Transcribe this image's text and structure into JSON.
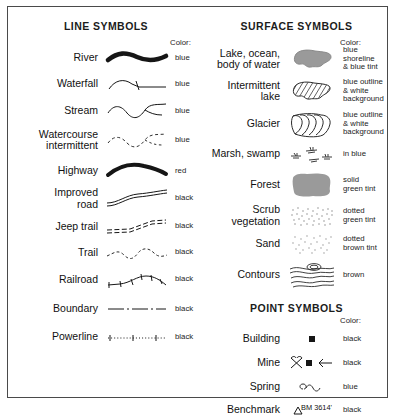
{
  "legend": {
    "sections": [
      {
        "id": "line-symbols",
        "title": "LINE SYMBOLS",
        "color_header": "Color:",
        "rows": [
          {
            "label": "River",
            "symbol": "river-thick-wavy-line",
            "color": "blue"
          },
          {
            "label": "Waterfall",
            "symbol": "waterfall-line-with-tick",
            "color": "blue"
          },
          {
            "label": "Stream",
            "symbol": "stream-thin-wavy-line",
            "color": "blue"
          },
          {
            "label": "Watercourse\nintermittent",
            "symbol": "watercourse-intermittent-dashed-line",
            "color": "blue"
          },
          {
            "label": "Highway",
            "symbol": "highway-thick-tapered-line",
            "color": "red"
          },
          {
            "label": "Improved\nroad",
            "symbol": "improved-road-double-line",
            "color": "black"
          },
          {
            "label": "Jeep trail",
            "symbol": "jeep-trail-double-dashed-line",
            "color": "black"
          },
          {
            "label": "Trail",
            "symbol": "trail-broken-dashed-line",
            "color": "black"
          },
          {
            "label": "Railroad",
            "symbol": "railroad-line-with-crossties",
            "color": "black"
          },
          {
            "label": "Boundary",
            "symbol": "boundary-dash-dot-line",
            "color": "black"
          },
          {
            "label": "Powerline",
            "symbol": "powerline-dotted-line-with-ticks",
            "color": "black"
          }
        ]
      },
      {
        "id": "surface-symbols",
        "title": "SURFACE SYMBOLS",
        "color_header": "Color:",
        "rows": [
          {
            "label": "Lake, ocean,\nbody of water",
            "symbol": "lake-solid-fill-blob",
            "color": "blue shoreline\n& blue tint"
          },
          {
            "label": "Intermittent\nlake",
            "symbol": "intermittent-lake-hatched-blob",
            "color": "blue outline\n& white\nbackground"
          },
          {
            "label": "Glacier",
            "symbol": "glacier-nested-curves",
            "color": "blue outline\n& white\nbackground"
          },
          {
            "label": "Marsh, swamp",
            "symbol": "marsh-swamp-grass-tufts",
            "color": "in blue"
          },
          {
            "label": "Forest",
            "symbol": "forest-solid-tint-blob",
            "color": "solid\ngreen tint"
          },
          {
            "label": "Scrub\nvegetation",
            "symbol": "scrub-vegetation-stipple",
            "color": "dotted\ngreen tint"
          },
          {
            "label": "Sand",
            "symbol": "sand-stipple",
            "color": "dotted\nbrown tint"
          },
          {
            "label": "Contours",
            "symbol": "contours-nested-wavy-lines",
            "color": "brown"
          }
        ]
      },
      {
        "id": "point-symbols",
        "title": "POINT SYMBOLS",
        "color_header": "Color:",
        "rows": [
          {
            "label": "Building",
            "symbol": "building-filled-square",
            "color": "black"
          },
          {
            "label": "Mine",
            "symbol": "mine-crossed-picks-square-shaft",
            "color": "black"
          },
          {
            "label": "Spring",
            "symbol": "spring-loop-with-wavy-tail",
            "color": "blue"
          },
          {
            "label": "Benchmark",
            "symbol": "benchmark-triangle",
            "color": "black",
            "annotation": "BM 3614'"
          }
        ]
      }
    ]
  },
  "palette": {
    "border": "#4a4a4a",
    "ink": "#111111",
    "fill_gray": "#9a9a9a",
    "stipple": "#8d8d8d"
  }
}
